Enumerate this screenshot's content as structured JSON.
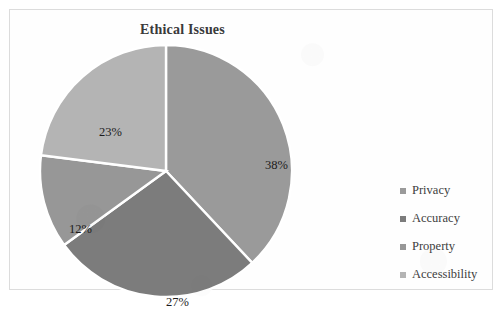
{
  "chart_data": {
    "type": "pie",
    "title": "Ethical Issues",
    "categories": [
      "Privacy",
      "Accuracy",
      "Property",
      "Accessibility"
    ],
    "values": [
      38,
      27,
      12,
      23
    ],
    "value_labels": [
      "38%",
      "27%",
      "12%",
      "23%"
    ],
    "colors": [
      "#9a9a9a",
      "#7c7c7c",
      "#979797",
      "#b4b4b4"
    ],
    "legend_position": "right",
    "grid": false,
    "start_angle_deg": 0,
    "direction": "clockwise",
    "separator_color": "#ffffff",
    "frame_color": "#dcdcdc",
    "label_color": "#1c1c1c",
    "legend_text_color": "#404040",
    "xlabel": "",
    "ylabel": ""
  },
  "legend": {
    "items": [
      {
        "label": "Privacy",
        "color": "#9a9a9a"
      },
      {
        "label": "Accuracy",
        "color": "#7c7c7c"
      },
      {
        "label": "Property",
        "color": "#979797"
      },
      {
        "label": "Accessibility",
        "color": "#b4b4b4"
      }
    ]
  }
}
